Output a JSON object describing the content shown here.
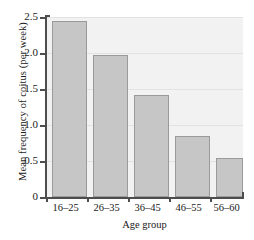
{
  "chart_data": {
    "type": "bar",
    "title": "",
    "categories": [
      "16–25",
      "26–35",
      "36–45",
      "46–55",
      "56–60"
    ],
    "values": [
      2.45,
      1.97,
      1.41,
      0.85,
      0.54
    ],
    "xlabel": "Age group",
    "ylabel": "Mean frequency of coitus (per week)",
    "ylim": [
      0,
      2.5
    ],
    "ytick_labels": [
      "2.5",
      "2.0",
      "1.5",
      "1.0",
      "0.5",
      "0"
    ],
    "ytick_values": [
      2.5,
      2.0,
      1.5,
      1.0,
      0.5,
      0
    ],
    "grid": true,
    "legend": false,
    "colors": {
      "bar_fill": "#c6c6c6",
      "bar_edge": "#9a9a9a",
      "plot_background": "#f2f2f2",
      "axis": "#4d4d4d",
      "gridline": "#e2e2e2",
      "text": "#1a1a1a"
    }
  }
}
